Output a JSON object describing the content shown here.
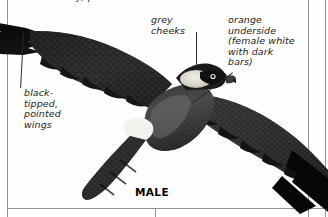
{
  "page": {
    "background_color": "#ffffff",
    "rule_color": "#8f9296",
    "clipped_top_text": "y, pointed"
  },
  "figure": {
    "caption": "MALE",
    "plumage_color": "#1b1b1b",
    "cheek_color": "#d9d6cf",
    "underside_color": "#4a4a4a",
    "labels": [
      {
        "id": "grey-cheeks",
        "text": "grey\ncheeks",
        "leader": "vertical-down"
      },
      {
        "id": "orange-underside",
        "text": "orange\nunderside\n(female white\nwith dark\nbars)",
        "leader": "diagonal-down-left"
      },
      {
        "id": "black-tipped-wings",
        "text": "black-\ntipped,\npointed\nwings",
        "leader": "vertical-up"
      }
    ]
  }
}
